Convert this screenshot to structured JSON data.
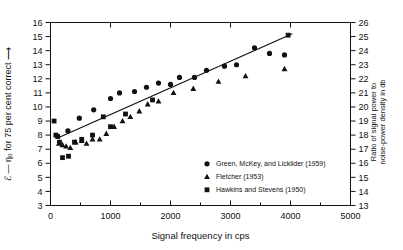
{
  "chart_data": {
    "type": "scatter",
    "title": "",
    "xlabel": "Signal frequency in cps",
    "ylabel": "ℰ — η₀ for 75 per cent correct ⟶",
    "ylabel_right": "Ratio of signal power to noise-power density in db",
    "xlim": [
      0,
      5000
    ],
    "ylim": [
      3,
      16
    ],
    "ylim_right": [
      13,
      26
    ],
    "xticks": [
      0,
      1000,
      2000,
      3000,
      4000,
      5000
    ],
    "xtick_labels": [
      "0",
      "1000",
      "2000",
      "3000",
      "4000",
      "5000"
    ],
    "xminor_step": 500,
    "yticks": [
      3,
      4,
      5,
      6,
      7,
      8,
      9,
      10,
      11,
      12,
      13,
      14,
      15,
      16
    ],
    "ytick_labels": [
      "3",
      "4",
      "5",
      "6",
      "7",
      "8",
      "9",
      "10",
      "11",
      "12",
      "13",
      "14",
      "15",
      "16"
    ],
    "yticks_right": [
      13,
      14,
      15,
      16,
      17,
      18,
      19,
      20,
      21,
      22,
      23,
      24,
      25,
      26
    ],
    "ytick_labels_right": [
      "13",
      "14",
      "15",
      "16",
      "17",
      "18",
      "19",
      "20",
      "21",
      "22",
      "23",
      "24",
      "25",
      "26"
    ],
    "grid": false,
    "legend_position": "bottom-right",
    "series": [
      {
        "name": "Green, McKey, and Licklider (1959)",
        "marker": "circle",
        "color": "#111111",
        "points": [
          [
            290,
            8.3
          ],
          [
            480,
            9.2
          ],
          [
            720,
            9.8
          ],
          [
            1000,
            10.6
          ],
          [
            1150,
            11.0
          ],
          [
            1400,
            11.1
          ],
          [
            1600,
            11.4
          ],
          [
            1800,
            11.7
          ],
          [
            2000,
            11.6
          ],
          [
            2150,
            12.1
          ],
          [
            2400,
            12.1
          ],
          [
            2600,
            12.6
          ],
          [
            2900,
            12.9
          ],
          [
            3100,
            13.0
          ],
          [
            3400,
            14.2
          ],
          [
            3650,
            13.8
          ],
          [
            3900,
            13.7
          ]
        ]
      },
      {
        "name": "Fletcher (1953)",
        "marker": "triangle",
        "color": "#111111",
        "points": [
          [
            140,
            7.4
          ],
          [
            200,
            7.3
          ],
          [
            260,
            7.2
          ],
          [
            330,
            7.1
          ],
          [
            420,
            7.5
          ],
          [
            520,
            7.6
          ],
          [
            600,
            7.4
          ],
          [
            700,
            7.7
          ],
          [
            820,
            7.7
          ],
          [
            930,
            8.1
          ],
          [
            1060,
            8.6
          ],
          [
            1200,
            9.0
          ],
          [
            1330,
            9.3
          ],
          [
            1480,
            9.7
          ],
          [
            1620,
            10.2
          ],
          [
            1800,
            10.4
          ],
          [
            2050,
            11.0
          ],
          [
            2380,
            11.3
          ],
          [
            2800,
            11.8
          ],
          [
            3250,
            12.2
          ],
          [
            3900,
            12.7
          ]
        ]
      },
      {
        "name": "Hawkins and Stevens (1950)",
        "marker": "square",
        "color": "#111111",
        "points": [
          [
            60,
            9.0
          ],
          [
            90,
            8.0
          ],
          [
            120,
            7.9
          ],
          [
            150,
            7.5
          ],
          [
            200,
            6.4
          ],
          [
            300,
            6.5
          ],
          [
            400,
            7.5
          ],
          [
            520,
            7.7
          ],
          [
            700,
            8.0
          ],
          [
            880,
            9.3
          ],
          [
            1000,
            8.6
          ],
          [
            1250,
            9.5
          ],
          [
            1700,
            10.5
          ],
          [
            3960,
            15.1
          ]
        ]
      }
    ],
    "trend_line": {
      "name": "fitted line",
      "points": [
        [
          120,
          7.8
        ],
        [
          4030,
          15.2
        ]
      ]
    },
    "legend": [
      {
        "label": "Green, McKey, and Licklider (1959)",
        "marker": "circle"
      },
      {
        "label": "Fletcher (1953)",
        "marker": "triangle"
      },
      {
        "label": "Hawkins and Stevens (1950)",
        "marker": "square"
      }
    ]
  }
}
